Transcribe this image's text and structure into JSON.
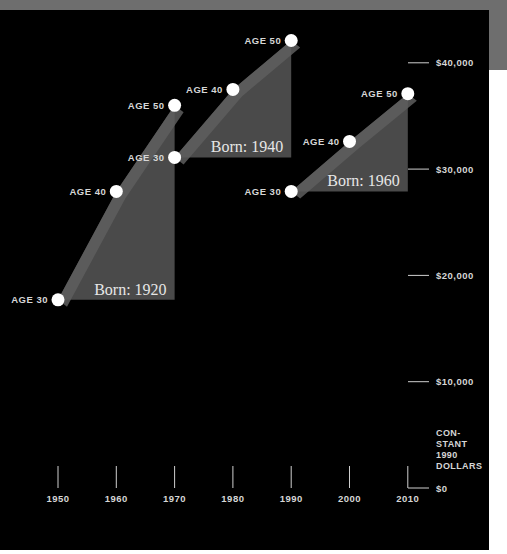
{
  "chart_data": {
    "type": "area",
    "title": "",
    "xlabel": "",
    "ylabel": "CONSTANT 1990 DOLLARS",
    "x_ticks": [
      1950,
      1960,
      1970,
      1980,
      1990,
      2000,
      2010
    ],
    "x_tick_labels": [
      "1950",
      "1960",
      "1970",
      "1980",
      "1990",
      "2000",
      "2010"
    ],
    "y_ticks": [
      0,
      10000,
      20000,
      30000,
      40000
    ],
    "y_tick_labels": [
      "$0",
      "$10,000",
      "$20,000",
      "$30,000",
      "$40,000"
    ],
    "xlim": [
      1950,
      2010
    ],
    "ylim": [
      0,
      42000
    ],
    "grid": false,
    "legend": "none",
    "series": [
      {
        "name": "Born: 1920",
        "x": [
          1950,
          1960,
          1970
        ],
        "labels": [
          "AGE 30",
          "AGE 40",
          "AGE 50"
        ],
        "values": [
          17700,
          27900,
          36000
        ]
      },
      {
        "name": "Born: 1940",
        "x": [
          1970,
          1980,
          1990
        ],
        "labels": [
          "AGE 30",
          "AGE 40",
          "AGE 50"
        ],
        "values": [
          31100,
          37500,
          42100
        ]
      },
      {
        "name": "Born: 1960",
        "x": [
          1990,
          2000,
          2010
        ],
        "labels": [
          "AGE 30",
          "AGE 40",
          "AGE 50"
        ],
        "values": [
          27900,
          32600,
          37100
        ]
      }
    ]
  },
  "axis": {
    "y_unit_label": "CON-\nSTANT\n1990\nDOLLARS"
  },
  "colors": {
    "background": "#000000",
    "fill": "#4a4a4a",
    "ribbon": "#5e5e5e",
    "point": "#ffffff",
    "text": "#d6d6d6"
  }
}
